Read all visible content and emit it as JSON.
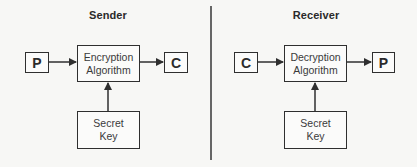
{
  "panels": [
    {
      "title": "Sender",
      "input": "P",
      "process": [
        "Encryption",
        "Algorithm"
      ],
      "output": "C",
      "key": [
        "Secret",
        "Key"
      ]
    },
    {
      "title": "Receiver",
      "input": "C",
      "process": [
        "Decryption",
        "Algorithm"
      ],
      "output": "P",
      "key": [
        "Secret",
        "Key"
      ]
    }
  ],
  "colors": {
    "stroke": "#2f2f2f",
    "divider": "#666666",
    "background": "#f7f7f5"
  }
}
